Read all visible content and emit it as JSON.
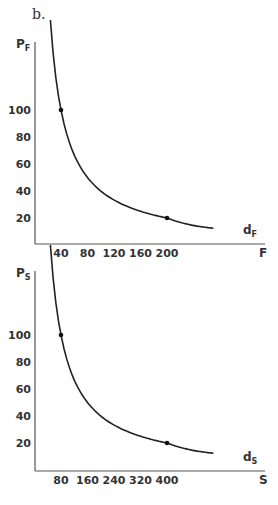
{
  "part_label": "b.",
  "chart_data": [
    {
      "type": "line",
      "title": "",
      "ylabel": "P",
      "ylabel_sub": "F",
      "xlabel": "F",
      "curve_label": "d",
      "curve_label_sub": "F",
      "y_ticks": [
        100,
        80,
        60,
        40,
        20
      ],
      "x_ticks": [
        40,
        80,
        120,
        160,
        200
      ],
      "marked_points": [
        {
          "x": 40,
          "y": 100
        },
        {
          "x": 200,
          "y": 20
        }
      ],
      "series": [
        {
          "name": "dF",
          "x": [
            20,
            40,
            80,
            120,
            160,
            200,
            280
          ],
          "y": [
            140,
            100,
            62,
            42,
            30,
            20,
            10
          ]
        }
      ],
      "grid": false
    },
    {
      "type": "line",
      "title": "",
      "ylabel": "P",
      "ylabel_sub": "S",
      "xlabel": "S",
      "curve_label": "d",
      "curve_label_sub": "S",
      "y_ticks": [
        100,
        80,
        60,
        40,
        20
      ],
      "x_ticks": [
        80,
        160,
        240,
        320,
        400
      ],
      "marked_points": [
        {
          "x": 80,
          "y": 100
        },
        {
          "x": 400,
          "y": 20
        }
      ],
      "series": [
        {
          "name": "dS",
          "x": [
            40,
            80,
            160,
            240,
            320,
            400,
            560
          ],
          "y": [
            140,
            100,
            62,
            42,
            30,
            20,
            10
          ]
        }
      ],
      "grid": false
    }
  ]
}
